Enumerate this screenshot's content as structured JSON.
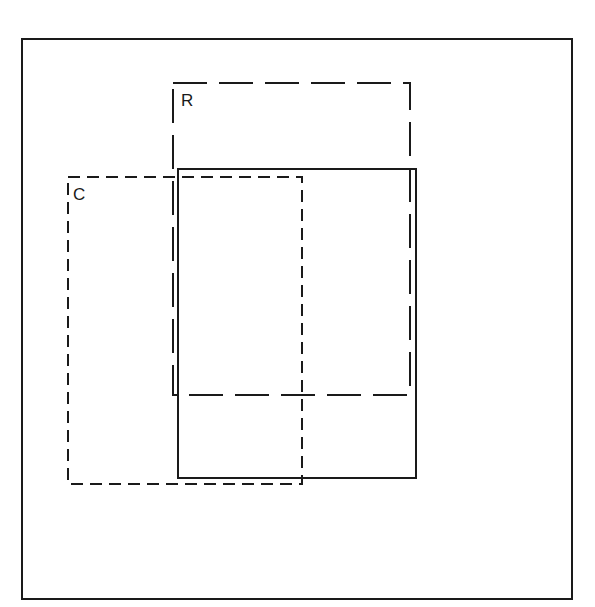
{
  "diagram": {
    "type": "overlapping-rectangles",
    "background": "#ffffff",
    "stroke_color": "#1a1a1a",
    "frame": {
      "x": 22,
      "y": 39,
      "width": 550,
      "height": 560,
      "style": "solid"
    },
    "boxes": [
      {
        "id": "R",
        "label": "R",
        "style": "long-dash",
        "x": 173,
        "y": 83,
        "width": 237,
        "height": 312,
        "label_pos": {
          "x": 181,
          "y": 106
        }
      },
      {
        "id": "C",
        "label": "C",
        "style": "short-dash",
        "x": 68,
        "y": 177,
        "width": 234,
        "height": 307,
        "label_pos": {
          "x": 73,
          "y": 200
        }
      },
      {
        "id": "S",
        "label": "",
        "style": "solid",
        "x": 178,
        "y": 169,
        "width": 238,
        "height": 309
      }
    ]
  },
  "labels": {
    "r": "R",
    "c": "C"
  }
}
